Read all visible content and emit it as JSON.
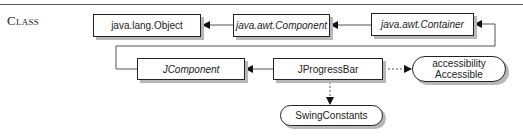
{
  "section": {
    "label": "Class"
  },
  "diagram": {
    "nodes": [
      {
        "id": "object",
        "label": "java.lang.Object",
        "kind": "class",
        "italic": false
      },
      {
        "id": "component",
        "label": "java.awt.Component",
        "kind": "abstract-class",
        "italic": true
      },
      {
        "id": "container",
        "label": "java.awt.Container",
        "kind": "class",
        "italic": true
      },
      {
        "id": "jcomponent",
        "label": "JComponent",
        "kind": "abstract-class",
        "italic": true
      },
      {
        "id": "jprogressbar",
        "label": "JProgressBar",
        "kind": "class",
        "italic": false
      },
      {
        "id": "accessible",
        "label_line1": "accessibility",
        "label_line2": "Accessible",
        "kind": "interface"
      },
      {
        "id": "swingconstants",
        "label": "SwingConstants",
        "kind": "interface"
      }
    ],
    "edges": [
      {
        "from": "component",
        "to": "object",
        "type": "extends"
      },
      {
        "from": "container",
        "to": "component",
        "type": "extends"
      },
      {
        "from": "jcomponent",
        "to": "container",
        "type": "extends"
      },
      {
        "from": "jprogressbar",
        "to": "jcomponent",
        "type": "extends"
      },
      {
        "from": "jprogressbar",
        "to": "accessible",
        "type": "implements"
      },
      {
        "from": "jprogressbar",
        "to": "swingconstants",
        "type": "implements"
      }
    ]
  }
}
